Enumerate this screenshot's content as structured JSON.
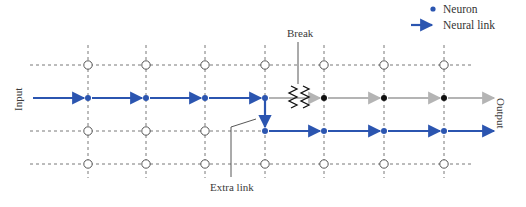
{
  "legend": {
    "neuron_label": "Neuron",
    "link_label": "Neural link"
  },
  "labels": {
    "input": "Input",
    "output": "Output",
    "break": "Break",
    "extra_link": "Extra link"
  },
  "colors": {
    "active": "#2b55b0",
    "inactive": "#b4b4b4",
    "broken_neuron": "#111111",
    "grid": "#6a6a6a",
    "text": "#333333"
  },
  "grid": {
    "columns_x": [
      88,
      146,
      205,
      265,
      324,
      384,
      444
    ],
    "rows_y": [
      65,
      98,
      131,
      164
    ]
  }
}
